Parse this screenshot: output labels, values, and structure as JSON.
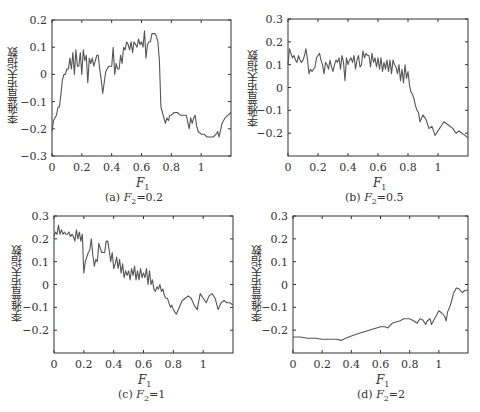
{
  "figure": {
    "ylabel": "李雅普诺夫指数",
    "xlabel": "F",
    "xlabel_sub": "1"
  },
  "chart_data": [
    {
      "type": "line",
      "panel": "a",
      "caption": "(a) F2=0.2",
      "caption_prefix": "(a)",
      "caption_var": "F",
      "caption_sub": "2",
      "caption_value": "=0.2",
      "xlabel": "F1",
      "ylabel": "李雅普诺夫指数",
      "xlim": [
        0,
        1.2
      ],
      "ylim": [
        -0.3,
        0.2
      ],
      "xticks": [
        0,
        0.2,
        0.4,
        0.6,
        0.8,
        1
      ],
      "xtick_labels": [
        "0",
        "0.2",
        "0.4",
        "0.6",
        "0.8",
        "1"
      ],
      "yticks": [
        0.2,
        0.1,
        0,
        -0.1,
        -0.2,
        -0.3
      ],
      "ytick_labels": [
        "0.2",
        "0.1",
        "0",
        "−0.1",
        "−0.2",
        "−0.3"
      ],
      "grid": false,
      "box": {
        "left": 52,
        "top": 20,
        "right": 231,
        "bottom": 156
      },
      "series": [
        {
          "name": "Lyapunov exponent",
          "x": [
            0,
            0.01,
            0.02,
            0.03,
            0.04,
            0.05,
            0.06,
            0.07,
            0.08,
            0.09,
            0.1,
            0.11,
            0.12,
            0.13,
            0.14,
            0.15,
            0.16,
            0.17,
            0.18,
            0.19,
            0.2,
            0.21,
            0.22,
            0.23,
            0.24,
            0.25,
            0.26,
            0.27,
            0.28,
            0.29,
            0.3,
            0.31,
            0.32,
            0.33,
            0.34,
            0.35,
            0.36,
            0.37,
            0.38,
            0.39,
            0.4,
            0.41,
            0.42,
            0.43,
            0.44,
            0.45,
            0.46,
            0.47,
            0.48,
            0.49,
            0.5,
            0.51,
            0.52,
            0.53,
            0.54,
            0.55,
            0.56,
            0.57,
            0.58,
            0.59,
            0.6,
            0.61,
            0.62,
            0.63,
            0.64,
            0.65,
            0.66,
            0.67,
            0.68,
            0.69,
            0.7,
            0.71,
            0.72,
            0.73,
            0.74,
            0.75,
            0.76,
            0.77,
            0.78,
            0.79,
            0.8,
            0.82,
            0.84,
            0.86,
            0.88,
            0.9,
            0.92,
            0.93,
            0.94,
            0.95,
            0.96,
            0.97,
            0.98,
            1.0,
            1.02,
            1.04,
            1.06,
            1.08,
            1.1,
            1.11,
            1.12,
            1.14,
            1.16,
            1.18,
            1.2
          ],
          "y": [
            -0.21,
            -0.17,
            -0.16,
            -0.15,
            -0.12,
            -0.12,
            -0.07,
            -0.02,
            0.0,
            0.0,
            0.02,
            0.02,
            0.06,
            0.02,
            0.08,
            0.0,
            0.09,
            0.03,
            0.03,
            0.08,
            0.0,
            0.09,
            0.05,
            0.07,
            -0.03,
            0.06,
            0.04,
            0.06,
            0.03,
            0.05,
            0.07,
            0.07,
            0.02,
            -0.02,
            -0.07,
            -0.03,
            0.01,
            0.02,
            0.03,
            0.03,
            0.03,
            0.1,
            0.0,
            0.04,
            0.02,
            0.02,
            0.07,
            0.04,
            0.1,
            0.09,
            0.12,
            0.11,
            0.09,
            0.12,
            0.08,
            0.12,
            0.11,
            0.1,
            0.13,
            0.11,
            0.12,
            0.1,
            0.16,
            0.06,
            0.11,
            0.12,
            0.12,
            0.15,
            0.15,
            0.15,
            0.14,
            0.12,
            0.05,
            -0.12,
            -0.14,
            -0.16,
            -0.18,
            -0.16,
            -0.17,
            -0.15,
            -0.15,
            -0.14,
            -0.14,
            -0.15,
            -0.15,
            -0.15,
            -0.2,
            -0.16,
            -0.18,
            -0.16,
            -0.15,
            -0.19,
            -0.21,
            -0.22,
            -0.22,
            -0.23,
            -0.23,
            -0.23,
            -0.22,
            -0.21,
            -0.23,
            -0.18,
            -0.16,
            -0.15,
            -0.14
          ]
        }
      ]
    },
    {
      "type": "line",
      "panel": "b",
      "caption": "(b) F2=0.5",
      "caption_prefix": "(b)",
      "caption_var": "F",
      "caption_sub": "2",
      "caption_value": "=0.5",
      "xlabel": "F1",
      "ylabel": "李雅普诺夫指数",
      "xlim": [
        0,
        1.2
      ],
      "ylim": [
        -0.3,
        0.3
      ],
      "xticks": [
        0,
        0.2,
        0.4,
        0.6,
        0.8,
        1
      ],
      "xtick_labels": [
        "0",
        "0.2",
        "0.4",
        "0.6",
        "0.8",
        "1"
      ],
      "yticks": [
        0.3,
        0.2,
        0.1,
        0,
        -0.1,
        -0.2
      ],
      "ytick_labels": [
        "0.3",
        "0.2",
        "0.1",
        "0",
        "−0.1",
        "−0.2"
      ],
      "grid": false,
      "box": {
        "left": 288,
        "top": 19,
        "right": 468,
        "bottom": 156
      },
      "series": [
        {
          "name": "Lyapunov exponent",
          "x": [
            0,
            0.01,
            0.02,
            0.03,
            0.04,
            0.05,
            0.06,
            0.07,
            0.08,
            0.09,
            0.1,
            0.11,
            0.12,
            0.13,
            0.14,
            0.15,
            0.16,
            0.17,
            0.18,
            0.19,
            0.2,
            0.21,
            0.22,
            0.23,
            0.24,
            0.25,
            0.26,
            0.27,
            0.28,
            0.29,
            0.3,
            0.31,
            0.32,
            0.33,
            0.34,
            0.35,
            0.36,
            0.37,
            0.38,
            0.39,
            0.4,
            0.41,
            0.42,
            0.43,
            0.44,
            0.45,
            0.46,
            0.47,
            0.48,
            0.49,
            0.5,
            0.51,
            0.52,
            0.53,
            0.54,
            0.55,
            0.56,
            0.57,
            0.58,
            0.59,
            0.6,
            0.61,
            0.62,
            0.63,
            0.64,
            0.65,
            0.66,
            0.67,
            0.68,
            0.69,
            0.7,
            0.71,
            0.72,
            0.73,
            0.74,
            0.75,
            0.76,
            0.77,
            0.78,
            0.79,
            0.8,
            0.81,
            0.82,
            0.83,
            0.84,
            0.85,
            0.86,
            0.87,
            0.88,
            0.9,
            0.92,
            0.94,
            0.96,
            0.98,
            1.0,
            1.02,
            1.04,
            1.06,
            1.08,
            1.1,
            1.12,
            1.14,
            1.16,
            1.18,
            1.2
          ],
          "y": [
            0.1,
            0.17,
            0.15,
            0.13,
            0.14,
            0.12,
            0.11,
            0.14,
            0.12,
            0.11,
            0.12,
            0.14,
            0.17,
            0.12,
            0.06,
            0.08,
            0.07,
            0.08,
            0.09,
            0.13,
            0.14,
            0.15,
            0.12,
            0.1,
            0.06,
            0.11,
            0.1,
            0.08,
            0.12,
            0.09,
            0.07,
            0.1,
            0.12,
            0.11,
            0.13,
            0.08,
            0.14,
            0.11,
            0.03,
            0.13,
            0.1,
            0.12,
            0.13,
            0.11,
            0.14,
            0.08,
            0.12,
            0.14,
            0.09,
            0.1,
            0.16,
            0.13,
            0.15,
            0.14,
            0.14,
            0.09,
            0.15,
            0.11,
            0.13,
            0.09,
            0.13,
            0.08,
            0.13,
            0.07,
            0.11,
            0.08,
            0.12,
            0.07,
            0.12,
            0.06,
            0.12,
            0.1,
            0.09,
            0.06,
            0.1,
            0.03,
            0.08,
            0.02,
            0.1,
            0.04,
            0.07,
            0.01,
            -0.02,
            -0.03,
            -0.05,
            -0.08,
            -0.1,
            -0.11,
            -0.15,
            -0.12,
            -0.14,
            -0.18,
            -0.17,
            -0.21,
            -0.19,
            -0.17,
            -0.15,
            -0.16,
            -0.17,
            -0.18,
            -0.2,
            -0.19,
            -0.2,
            -0.21,
            -0.22
          ]
        }
      ]
    },
    {
      "type": "line",
      "panel": "c",
      "caption": "(c) F2=1",
      "caption_prefix": "(c)",
      "caption_var": "F",
      "caption_sub": "2",
      "caption_value": "=1",
      "xlabel": "F1",
      "ylabel": "李雅普诺夫指数",
      "xlim": [
        0,
        1.2
      ],
      "ylim": [
        -0.3,
        0.3
      ],
      "xticks": [
        0,
        0.2,
        0.4,
        0.6,
        0.8,
        1
      ],
      "xtick_labels": [
        "0",
        "0.2",
        "0.4",
        "0.6",
        "0.8",
        "1"
      ],
      "yticks": [
        0.3,
        0.2,
        0.1,
        0,
        -0.1,
        -0.2
      ],
      "ytick_labels": [
        "0.3",
        "0.2",
        "0.1",
        "0",
        "−0.1",
        "−0.2"
      ],
      "grid": false,
      "box": {
        "left": 54,
        "top": 216,
        "right": 233,
        "bottom": 353
      },
      "series": [
        {
          "name": "Lyapunov exponent",
          "x": [
            0,
            0.01,
            0.02,
            0.03,
            0.04,
            0.05,
            0.06,
            0.07,
            0.08,
            0.09,
            0.1,
            0.11,
            0.12,
            0.13,
            0.14,
            0.15,
            0.16,
            0.17,
            0.18,
            0.19,
            0.2,
            0.21,
            0.22,
            0.23,
            0.24,
            0.25,
            0.26,
            0.27,
            0.28,
            0.29,
            0.3,
            0.31,
            0.32,
            0.33,
            0.34,
            0.35,
            0.36,
            0.37,
            0.38,
            0.39,
            0.4,
            0.41,
            0.42,
            0.43,
            0.44,
            0.45,
            0.46,
            0.47,
            0.48,
            0.49,
            0.5,
            0.51,
            0.52,
            0.53,
            0.54,
            0.55,
            0.56,
            0.57,
            0.58,
            0.59,
            0.6,
            0.61,
            0.62,
            0.63,
            0.64,
            0.65,
            0.66,
            0.67,
            0.68,
            0.69,
            0.7,
            0.71,
            0.72,
            0.73,
            0.74,
            0.75,
            0.76,
            0.77,
            0.78,
            0.79,
            0.8,
            0.82,
            0.84,
            0.86,
            0.88,
            0.9,
            0.92,
            0.94,
            0.96,
            0.98,
            1.0,
            1.02,
            1.04,
            1.06,
            1.08,
            1.1,
            1.12,
            1.14,
            1.16,
            1.18,
            1.2
          ],
          "y": [
            0.21,
            0.23,
            0.22,
            0.26,
            0.22,
            0.24,
            0.22,
            0.23,
            0.22,
            0.22,
            0.23,
            0.21,
            0.22,
            0.21,
            0.19,
            0.24,
            0.2,
            0.23,
            0.19,
            0.22,
            0.05,
            0.1,
            0.12,
            0.14,
            0.15,
            0.2,
            0.13,
            0.08,
            0.11,
            0.1,
            0.18,
            0.16,
            0.14,
            0.14,
            0.14,
            0.19,
            0.19,
            0.15,
            0.1,
            0.14,
            0.07,
            0.09,
            0.12,
            0.07,
            0.11,
            0.05,
            0.09,
            0.03,
            0.06,
            0.04,
            0.06,
            0.02,
            0.07,
            0.04,
            0.08,
            0.02,
            0.06,
            0.02,
            0.07,
            0.03,
            0.05,
            0.03,
            0.07,
            0.0,
            0.06,
            0.0,
            0.02,
            -0.02,
            -0.03,
            -0.01,
            -0.02,
            0.0,
            -0.03,
            -0.02,
            -0.05,
            -0.06,
            -0.06,
            -0.08,
            -0.1,
            -0.09,
            -0.11,
            -0.13,
            -0.1,
            -0.07,
            -0.06,
            -0.05,
            -0.06,
            -0.09,
            -0.11,
            -0.04,
            -0.06,
            -0.08,
            -0.05,
            -0.04,
            -0.06,
            -0.11,
            -0.08,
            -0.07,
            -0.08,
            -0.08,
            -0.09
          ]
        }
      ]
    },
    {
      "type": "line",
      "panel": "d",
      "caption": "(d) F2=2",
      "caption_prefix": "(d)",
      "caption_var": "F",
      "caption_sub": "2",
      "caption_value": "=2",
      "xlabel": "F1",
      "ylabel": "李雅普诺夫指数",
      "xlim": [
        0,
        1.2
      ],
      "ylim": [
        -0.3,
        0.3
      ],
      "xticks": [
        0,
        0.2,
        0.4,
        0.6,
        0.8,
        1
      ],
      "xtick_labels": [
        "0",
        "0.2",
        "0.4",
        "0.6",
        "0.8",
        "1"
      ],
      "yticks": [
        0.3,
        0.2,
        0.1,
        0,
        -0.1,
        -0.2
      ],
      "ytick_labels": [
        "0.3",
        "0.2",
        "0.1",
        "0",
        "−0.1",
        "−0.2"
      ],
      "grid": false,
      "box": {
        "left": 293,
        "top": 216,
        "right": 468,
        "bottom": 353
      },
      "series": [
        {
          "name": "Lyapunov exponent",
          "x": [
            0,
            0.05,
            0.1,
            0.15,
            0.2,
            0.25,
            0.3,
            0.33,
            0.36,
            0.4,
            0.45,
            0.5,
            0.55,
            0.6,
            0.63,
            0.65,
            0.68,
            0.7,
            0.73,
            0.76,
            0.8,
            0.83,
            0.85,
            0.87,
            0.89,
            0.91,
            0.92,
            0.94,
            0.95,
            0.97,
            0.98,
            1.0,
            1.02,
            1.04,
            1.05,
            1.06,
            1.08,
            1.1,
            1.12,
            1.14,
            1.16,
            1.18,
            1.2
          ],
          "y": [
            -0.23,
            -0.23,
            -0.235,
            -0.235,
            -0.24,
            -0.24,
            -0.24,
            -0.245,
            -0.235,
            -0.225,
            -0.215,
            -0.205,
            -0.195,
            -0.185,
            -0.185,
            -0.19,
            -0.17,
            -0.165,
            -0.16,
            -0.15,
            -0.15,
            -0.16,
            -0.17,
            -0.15,
            -0.155,
            -0.175,
            -0.16,
            -0.15,
            -0.175,
            -0.15,
            -0.14,
            -0.115,
            -0.125,
            -0.14,
            -0.16,
            -0.12,
            -0.09,
            -0.04,
            -0.015,
            -0.02,
            -0.035,
            -0.025,
            -0.025
          ]
        }
      ]
    }
  ]
}
